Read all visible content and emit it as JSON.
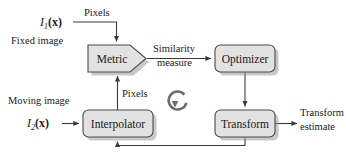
{
  "diagram": {
    "colors": {
      "box_fill": "#e2e2e2",
      "box_stroke": "#4a4a4a",
      "shadow": "#9a9a9a",
      "connector": "#3a3a3a",
      "loop_icon": "#6e6e6e",
      "text": "#1a1a1a",
      "background": "#ffffff"
    },
    "nodes": [
      {
        "id": "metric",
        "label": "Metric",
        "shape": "pentagon",
        "x": 88,
        "y": 45,
        "w": 57,
        "h": 27
      },
      {
        "id": "optimizer",
        "label": "Optimizer",
        "shape": "rounded-rectangle",
        "x": 215,
        "y": 45,
        "w": 60,
        "h": 27
      },
      {
        "id": "interpolator",
        "label": "Interpolator",
        "shape": "rounded-rectangle",
        "x": 83,
        "y": 110,
        "w": 70,
        "h": 27
      },
      {
        "id": "transform",
        "label": "Transform",
        "shape": "rounded-rectangle",
        "x": 215,
        "y": 110,
        "w": 60,
        "h": 27
      }
    ],
    "inputs": [
      {
        "id": "fixed-image",
        "symbol_base": "I",
        "symbol_sub": "1",
        "symbol_arg": "(x)",
        "caption": "Fixed image"
      },
      {
        "id": "moving-image",
        "symbol_base": "I",
        "symbol_sub": "2",
        "symbol_arg": "(x)",
        "caption": "Moving image"
      }
    ],
    "outputs": [
      {
        "id": "transform-estimate",
        "line1": "Transform",
        "line2": "estimate"
      }
    ],
    "edge_labels": {
      "pixels_top": "Pixels",
      "pixels_bottom": "Pixels",
      "similarity_line1": "Similarity",
      "similarity_line2": "measure"
    },
    "loop_icon": {
      "name": "circular-arrow-icon",
      "cx": 178,
      "cy": 99,
      "r": 9
    }
  }
}
